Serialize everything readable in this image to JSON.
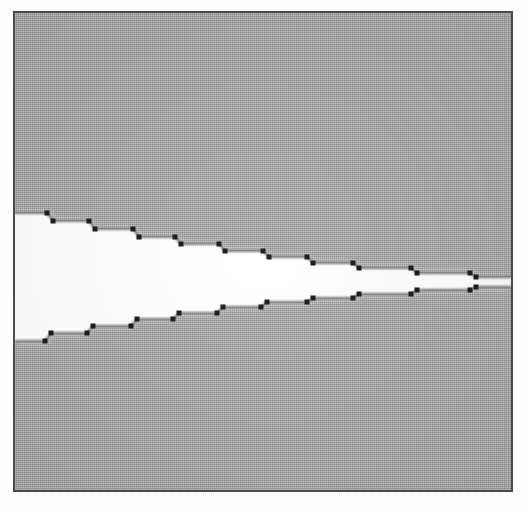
{
  "figure": {
    "caption_visible": false,
    "background_color": "#a9a9a9",
    "interior_fill_color": "#ffffff",
    "frame_border_color": "#4a4a4a",
    "page_color": "#fdfdfd",
    "line_color": "#3a3a3a",
    "marker_color": "#1a1a1a",
    "marker_shape": "square",
    "marker_size_px": 5,
    "line_width_px": 1.3
  },
  "frame": {
    "left": 13,
    "top": 11,
    "width": 500,
    "height": 481,
    "border_width": 2
  },
  "chart_data": {
    "type": "line",
    "title": "",
    "subtitle": "",
    "xlabel": "",
    "ylabel": "",
    "xlim": [
      0,
      496
    ],
    "ylim": [
      477,
      0
    ],
    "grid": false,
    "legend": null,
    "axis_tick_labels": {
      "x": [],
      "y": []
    },
    "annotations": [],
    "series": [
      {
        "name": "upper-envelope",
        "role": "upper boundary (descending staircase)",
        "marker": "square",
        "points": [
          [
            0,
            200
          ],
          [
            32,
            200
          ],
          [
            38,
            208
          ],
          [
            74,
            208
          ],
          [
            80,
            216
          ],
          [
            118,
            216
          ],
          [
            124,
            224
          ],
          [
            160,
            224
          ],
          [
            166,
            231
          ],
          [
            204,
            231
          ],
          [
            210,
            238
          ],
          [
            248,
            238
          ],
          [
            254,
            244
          ],
          [
            292,
            244
          ],
          [
            298,
            250
          ],
          [
            338,
            250
          ],
          [
            344,
            255
          ],
          [
            396,
            255
          ],
          [
            402,
            260
          ],
          [
            455,
            260
          ],
          [
            461,
            264
          ],
          [
            496,
            264
          ]
        ]
      },
      {
        "name": "lower-envelope",
        "role": "lower boundary (ascending staircase)",
        "marker": "square",
        "points": [
          [
            0,
            328
          ],
          [
            30,
            328
          ],
          [
            36,
            320
          ],
          [
            72,
            320
          ],
          [
            78,
            313
          ],
          [
            116,
            313
          ],
          [
            122,
            306
          ],
          [
            158,
            306
          ],
          [
            164,
            300
          ],
          [
            202,
            300
          ],
          [
            208,
            294
          ],
          [
            246,
            294
          ],
          [
            252,
            289
          ],
          [
            292,
            289
          ],
          [
            298,
            285
          ],
          [
            338,
            285
          ],
          [
            344,
            281
          ],
          [
            396,
            281
          ],
          [
            402,
            277
          ],
          [
            455,
            277
          ],
          [
            461,
            274
          ],
          [
            496,
            274
          ]
        ]
      }
    ]
  },
  "accessibility": {
    "alt_text": "A grainy scanned grayscale figure. A thin dark rectangle frames a gray halftone field. Two stepped polylines with small black square markers start near the left edge, one above and one below, and converge toward the right edge. The area between them is filled white, forming a horizontal wedge that narrows from left to right."
  }
}
